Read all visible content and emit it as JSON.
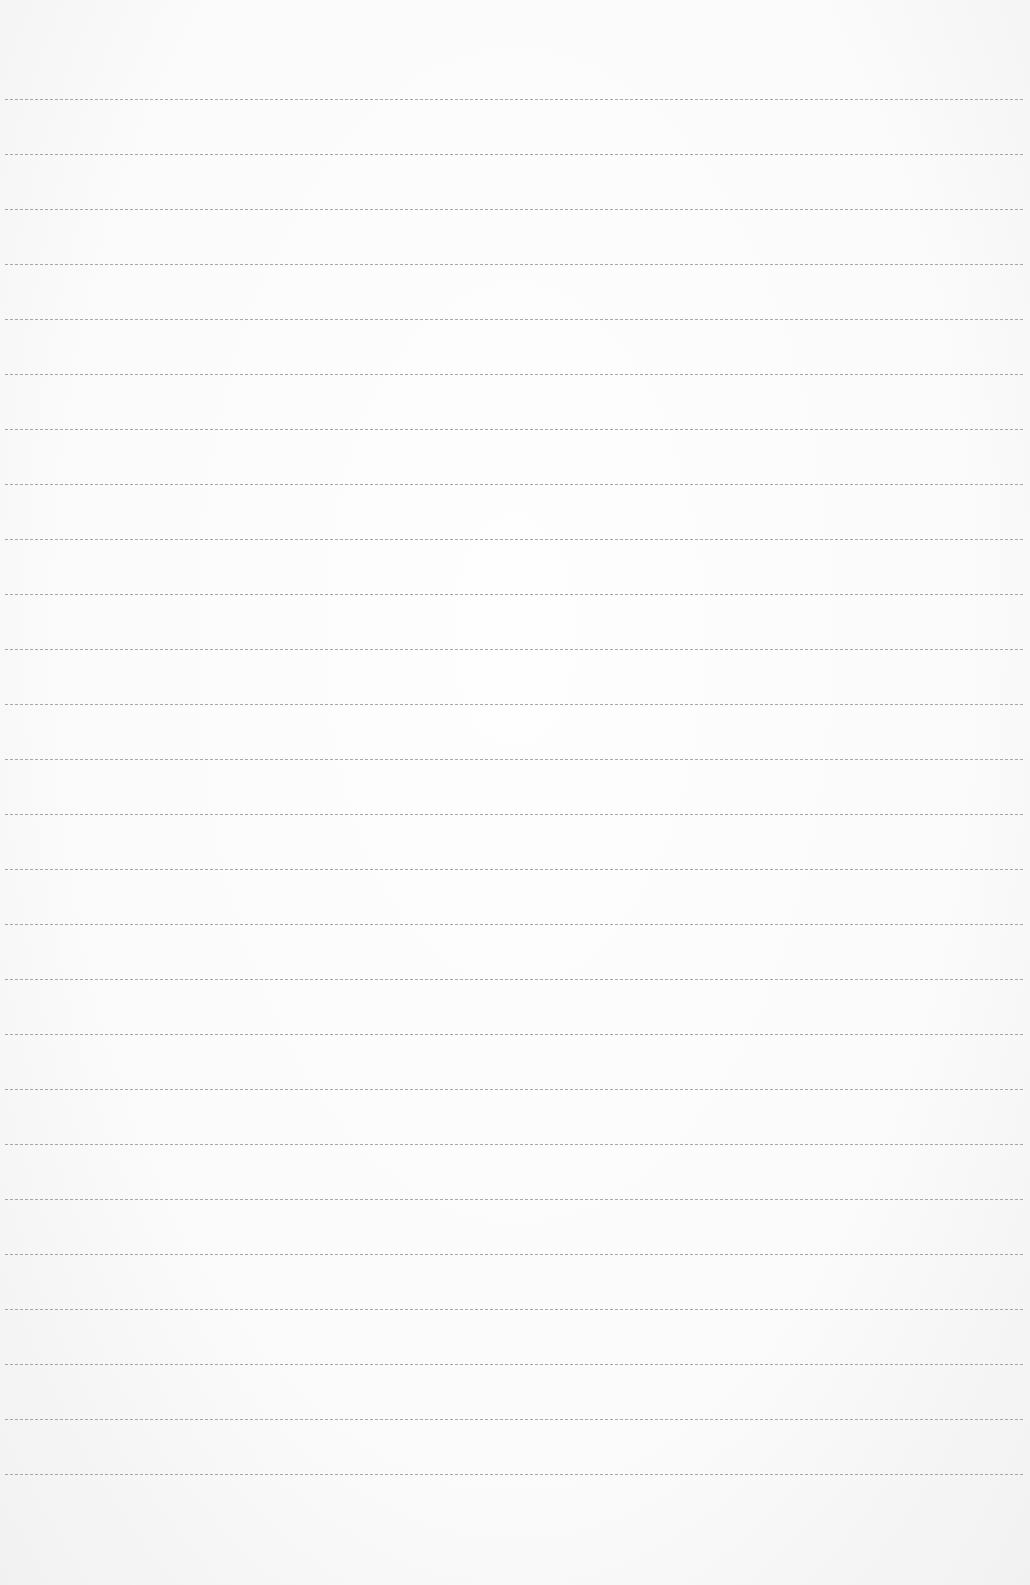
{
  "page": {
    "type": "blank lined paper",
    "background_color": "#fbfbfb",
    "line_color": "#9a9a9a",
    "line_count": 26,
    "first_line_y": 99,
    "line_spacing": 55,
    "line_left": 5,
    "line_width": 1018
  }
}
